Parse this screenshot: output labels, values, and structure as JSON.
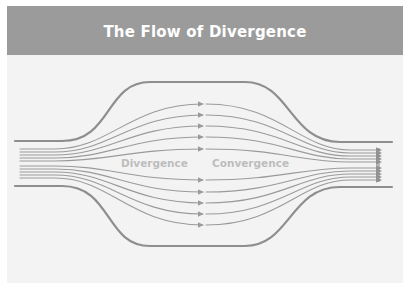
{
  "slide": {
    "title": "The Flow of Divergence",
    "colors": {
      "header_bg": "#9b9b9b",
      "title_text": "#ffffff",
      "panel_bg": "#f3f3f3",
      "boundary": "#8e8e8e",
      "streamline": "#9a9a9a",
      "label": "#bdbdbd"
    }
  },
  "diagram": {
    "labels": {
      "divergence": "Divergence",
      "convergence": "Convergence"
    },
    "boundary": {
      "left_x": 15,
      "right_x": 392,
      "narrow_top_y": 141,
      "narrow_bottom_y": 186,
      "wide_top_y": 82,
      "wide_bottom_y": 246,
      "mid_x": 203
    },
    "streamlines": {
      "count": 10,
      "narrow_ys_left": [
        149,
        152,
        155,
        158,
        161,
        166,
        169,
        172,
        175,
        178
      ],
      "narrow_ys_right": [
        150,
        153,
        156,
        159,
        162,
        168,
        171,
        174,
        177,
        180
      ],
      "wide_ys": [
        104,
        115,
        126,
        137,
        149,
        180,
        192,
        203,
        214,
        225
      ],
      "left_start_x": 20,
      "right_end_x": 381,
      "arrow_mid_tip_x": 203,
      "resume_x": 206
    }
  }
}
